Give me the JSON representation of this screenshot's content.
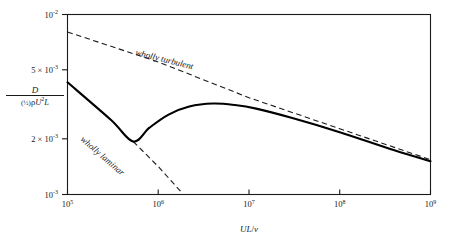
{
  "chart_data": {
    "type": "line",
    "title": "",
    "subtitle": "",
    "xlabel": "UL/ν",
    "ylabel": "D / ((½)ρU²L)",
    "xscale": "log",
    "yscale": "log",
    "xlim": [
      100000,
      1000000000
    ],
    "ylim": [
      0.001,
      0.01
    ],
    "grid": false,
    "legend_position": "inline-annotations",
    "x_ticks": [
      {
        "value": 100000,
        "label_mantissa": "10",
        "label_exponent": "5"
      },
      {
        "value": 1000000,
        "label_mantissa": "10",
        "label_exponent": "6"
      },
      {
        "value": 10000000,
        "label_mantissa": "10",
        "label_exponent": "7"
      },
      {
        "value": 100000000,
        "label_mantissa": "10",
        "label_exponent": "8"
      },
      {
        "value": 1000000000,
        "label_mantissa": "10",
        "label_exponent": "9"
      }
    ],
    "y_ticks": [
      {
        "value": 0.01,
        "label_mantissa": "10",
        "label_exponent": "-2",
        "prefix": ""
      },
      {
        "value": 0.005,
        "label_mantissa": "10",
        "label_exponent": "-3",
        "prefix": "5 × "
      },
      {
        "value": 0.002,
        "label_mantissa": "10",
        "label_exponent": "-3",
        "prefix": "2 × "
      },
      {
        "value": 0.001,
        "label_mantissa": "10",
        "label_exponent": "-3",
        "prefix": ""
      }
    ],
    "series": [
      {
        "name": "wholly turbulent",
        "style": "dashed",
        "annotation": "wholly turbulent",
        "points": [
          {
            "x": 100000,
            "y": 0.008
          },
          {
            "x": 1000000,
            "y": 0.00545
          },
          {
            "x": 10000000,
            "y": 0.00345
          },
          {
            "x": 100000000,
            "y": 0.00232
          },
          {
            "x": 1000000000,
            "y": 0.00156
          }
        ]
      },
      {
        "name": "wholly laminar",
        "style": "solid-then-dashed",
        "annotation": "wholly laminar",
        "solid_points": [
          {
            "x": 100000,
            "y": 0.0042
          },
          {
            "x": 300000,
            "y": 0.0026
          },
          {
            "x": 530000,
            "y": 0.00197
          }
        ],
        "dashed_points": [
          {
            "x": 530000,
            "y": 0.00197
          },
          {
            "x": 1000000,
            "y": 0.00143
          },
          {
            "x": 1800000,
            "y": 0.00103
          }
        ]
      },
      {
        "name": "transitional drag curve",
        "style": "solid",
        "annotation": "",
        "points": [
          {
            "x": 100000,
            "y": 0.0042
          },
          {
            "x": 300000,
            "y": 0.0026
          },
          {
            "x": 530000,
            "y": 0.00197
          },
          {
            "x": 800000,
            "y": 0.00235
          },
          {
            "x": 1300000,
            "y": 0.00278
          },
          {
            "x": 2200000,
            "y": 0.00308
          },
          {
            "x": 4000000,
            "y": 0.0032
          },
          {
            "x": 7000000,
            "y": 0.00314
          },
          {
            "x": 12000000,
            "y": 0.003
          },
          {
            "x": 30000000,
            "y": 0.00266
          },
          {
            "x": 100000000,
            "y": 0.00222
          },
          {
            "x": 400000000,
            "y": 0.00176
          },
          {
            "x": 1000000000,
            "y": 0.00153
          }
        ]
      }
    ],
    "annotations": [
      {
        "text": "wholly turbulent",
        "x_px": 135,
        "y_px": 55,
        "rotation": 14
      },
      {
        "text": "wholly laminar",
        "x_px": 78,
        "y_px": 148,
        "rotation": 40
      }
    ]
  },
  "ylabel_parts": {
    "numerator": "D",
    "denominator_half": "(½)",
    "denominator_rho": "ρ",
    "denominator_u": "U",
    "denominator_sup": "2",
    "denominator_l": "L"
  },
  "xlabel_parts": {
    "u": "U",
    "l": "L",
    "slash": "/",
    "nu": "ν"
  },
  "colors": {
    "background": "#ffffff",
    "ink": "#1a1a1a",
    "curve": "#000000"
  }
}
